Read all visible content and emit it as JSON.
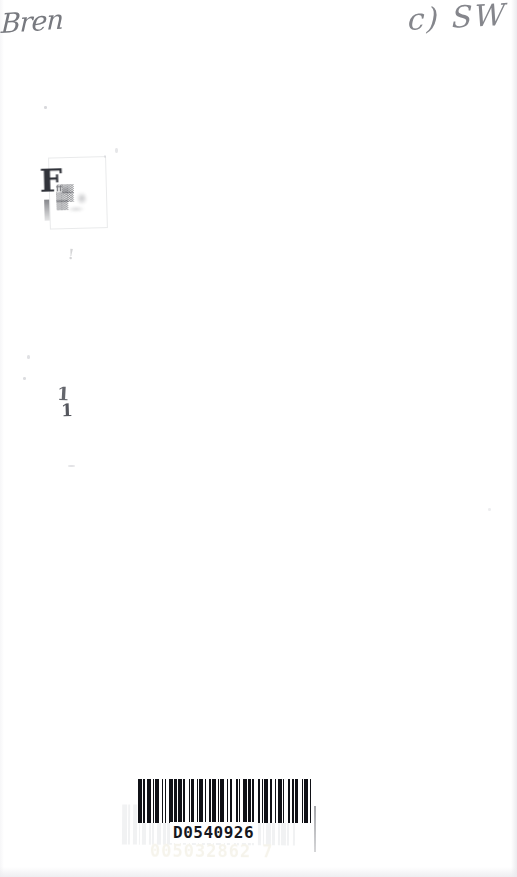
{
  "page": {
    "document_type": "scanned-blank-page",
    "background_color": "#ffffff",
    "width_px": 517,
    "height_px": 877
  },
  "annotations": {
    "top_left_handwriting": "Bren",
    "top_right_handwriting": "c) SW"
  },
  "stamp": {
    "letter": "F",
    "line1": "ﬀ▒▒",
    "line2": "▒▒▒",
    "line3": "▒▒"
  },
  "stray_marks": {
    "tick_upper": "1",
    "tick_lower": "1",
    "faint_mark": "!"
  },
  "barcode": {
    "number": "D0540926",
    "ghost_number": "005032862 7",
    "ghost_number_upper": "D0540926",
    "bar_pattern": [
      3,
      1,
      1,
      2,
      3,
      1,
      1,
      1,
      3,
      2,
      1,
      1,
      1,
      2,
      3,
      1,
      2,
      1,
      3,
      1,
      1,
      3,
      1,
      1,
      2,
      2,
      1,
      1,
      3,
      1,
      1,
      2,
      2,
      1,
      3,
      1,
      1,
      1,
      3,
      2,
      1,
      1,
      2,
      3,
      1,
      1,
      1,
      2,
      3,
      1,
      2,
      1,
      1,
      3,
      2,
      1,
      1,
      1,
      3,
      1,
      2,
      2,
      1,
      1,
      3,
      1,
      1,
      3,
      1,
      2,
      1,
      1,
      2,
      3,
      1,
      1,
      3,
      1,
      1,
      2
    ],
    "ghost_bar_pattern": [
      3,
      1,
      1,
      2,
      3,
      1,
      1,
      1,
      3,
      2,
      1,
      1,
      1,
      2,
      3,
      1,
      2,
      1,
      3,
      1,
      1,
      3,
      1,
      1,
      2,
      2,
      1,
      1,
      3,
      1,
      1,
      2,
      2,
      1,
      3,
      1,
      1,
      1,
      3,
      2,
      1,
      1,
      2,
      3,
      1,
      1,
      1,
      2,
      3,
      1,
      2,
      1,
      1,
      3,
      2,
      1,
      1,
      1,
      3,
      1,
      2,
      2,
      1,
      1,
      3,
      1,
      1,
      3,
      1,
      2
    ]
  },
  "colors": {
    "ink_dark": "#101116",
    "handwriting_gray": "#5d5f66",
    "ghost_yellow": "#b8a96a",
    "edge_gray": "#e8e8ec"
  }
}
